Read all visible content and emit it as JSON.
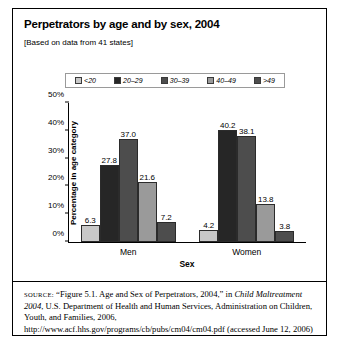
{
  "figure": {
    "title": "Perpetrators by age and by sex, 2004",
    "subtitle": "[Based on data from 41 states]",
    "source_prefix": "SOURCE:",
    "source_part1": " “Figure 5.1. Age and Sex of Perpetrators, 2004,” in ",
    "source_italic1": "Child Maltreatment 2004",
    "source_part2": ", U.S. Department of Health and Human Services, Administration on Children, Youth, and Families, 2006, http://www.acf.hhs.gov/programs/cb/pubs/cm04/cm04.pdf (accessed June 12, 2006)"
  },
  "chart_data": {
    "type": "bar",
    "title": "Perpetrators by age and by sex, 2004",
    "subtitle": "[Based on data from 41 states]",
    "xlabel": "Sex",
    "ylabel": "Percentage in age category",
    "categories": [
      "Men",
      "Women"
    ],
    "series": [
      {
        "name": "<20",
        "color": "#c8c8c8",
        "values": [
          6.3,
          4.2
        ]
      },
      {
        "name": "20–29",
        "color": "#262626",
        "values": [
          27.8,
          40.2
        ]
      },
      {
        "name": "30–39",
        "color": "#4d4d4d",
        "values": [
          37.0,
          38.1
        ]
      },
      {
        "name": "40–49",
        "color": "#9a9a9a",
        "values": [
          21.6,
          13.8
        ]
      },
      {
        "name": ">49",
        "color": "#4d4d4d",
        "values": [
          7.2,
          3.8
        ]
      }
    ],
    "ylim": [
      0,
      50
    ],
    "yticks": [
      "0%",
      "10%",
      "20%",
      "30%",
      "40%",
      "50%"
    ],
    "ytick_values": [
      0,
      10,
      20,
      30,
      40,
      50
    ],
    "grid": false,
    "legend_position": "top"
  }
}
